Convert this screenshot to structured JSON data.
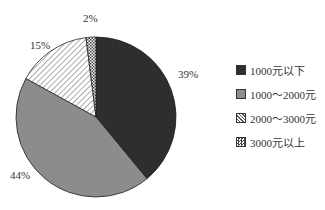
{
  "chart_data": {
    "type": "pie",
    "title": "",
    "start_angle": "12 o'clock, clockwise",
    "slices": [
      {
        "label": "1000元以下",
        "value": 39,
        "display": "39%",
        "fill": "#2e2e2e",
        "pattern": "solid-dark"
      },
      {
        "label": "1000～2000元",
        "value": 44,
        "display": "44%",
        "fill": "#8c8c8c",
        "pattern": "solid-gray"
      },
      {
        "label": "2000～3000元",
        "value": 15,
        "display": "15%",
        "fill": "#ffffff",
        "pattern": "diagonal-hatch"
      },
      {
        "label": "3000元以上",
        "value": 2,
        "display": "2%",
        "fill": "#ffffff",
        "pattern": "cross-hatch"
      }
    ],
    "legend_position": "right"
  },
  "labels": {
    "s0": "39%",
    "s1": "44%",
    "s2": "15%",
    "s3": "2%"
  },
  "legend": {
    "items": [
      {
        "label": "1000元以下"
      },
      {
        "label": "1000～2000元"
      },
      {
        "label": "2000～3000元"
      },
      {
        "label": "3000元以上"
      }
    ]
  }
}
